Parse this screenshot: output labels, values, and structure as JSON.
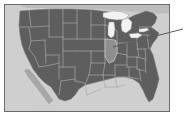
{
  "figure": {
    "kind": "map-thumbnail",
    "projection_note": "contiguous US outline with state boundaries"
  },
  "frame": {
    "border_color": "#6b6b6b",
    "border_width_px": 1,
    "margin_px": 4,
    "inner_width_px": 166,
    "inner_height_px": 108
  },
  "colors": {
    "page_background": "#ffffff",
    "ocean_background": "#cfcfcf",
    "land_fill": "#5e5e5e",
    "land_fill_shadow": "#525252",
    "state_border": "#a8a8a8",
    "coastline": "#7a7a7a",
    "lake_fill": "#f2f2f2",
    "lake_border": "#9a9a9a",
    "highlight_fill": "#8e8e8e",
    "highlight_border": "#d0d0d0",
    "pointer_line": "#5a5a5a",
    "neighbor_land": "#bdbdbd"
  },
  "annotation": {
    "pointer": {
      "name": "callout-leader-line",
      "from_x": 113,
      "from_y": 47,
      "to_x": 183,
      "to_y": 29,
      "stroke_width_px": 1,
      "target_label": "highlighted state"
    }
  },
  "highlighted_region": {
    "name": "Illinois",
    "fill": "#8e8e8e"
  },
  "lakes": [
    {
      "name": "Lake Superior"
    },
    {
      "name": "Lake Michigan"
    },
    {
      "name": "Lake Huron"
    },
    {
      "name": "Lake Erie"
    },
    {
      "name": "Lake Ontario"
    }
  ],
  "landmasses": [
    {
      "name": "contiguous-united-states"
    },
    {
      "name": "baja-california-peninsula"
    },
    {
      "name": "southern-canada-edge"
    },
    {
      "name": "florida-peninsula"
    }
  ]
}
